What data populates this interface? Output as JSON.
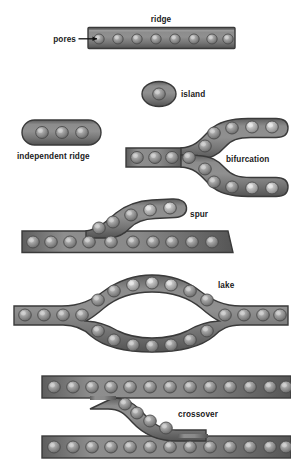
{
  "figure": {
    "background_color": "#ffffff",
    "ridge_fill_color": "#7c7c7c",
    "ridge_edge_color": "#3a3a3a",
    "pore_color": "#8f8f8f",
    "pore_highlight_color": "#c9c9c9",
    "label_color": "#1a1a1a"
  },
  "labels": {
    "ridge": "ridge",
    "pores": "pores",
    "island": "island",
    "independent_ridge": "independent ridge",
    "bifurcation": "bifurcation",
    "spur": "spur",
    "lake": "lake",
    "crossover": "crossover"
  },
  "features": [
    {
      "id": "ridge",
      "label": "ridge",
      "description": "straight horizontal ridge segment with a row of pores",
      "pore_count": 8
    },
    {
      "id": "pores",
      "label": "pores",
      "description": "leader line pointing to the first pore of the ridge",
      "pore_count": 1
    },
    {
      "id": "island",
      "label": "island",
      "description": "small isolated oval ridge fragment containing a single pore",
      "pore_count": 1
    },
    {
      "id": "independent-ridge",
      "label": "independent ridge",
      "description": "short isolated elongated ridge containing three pores",
      "pore_count": 3
    },
    {
      "id": "bifurcation",
      "label": "bifurcation",
      "description": "single ridge splitting into two ridges forming a Y fork",
      "pore_count": 16
    },
    {
      "id": "spur",
      "label": "spur",
      "description": "short ridge branching off from a longer ridge",
      "pore_count": 16
    },
    {
      "id": "lake",
      "label": "lake",
      "description": "ridge splitting and rejoining enclosing an empty oval area",
      "pore_count": 28
    },
    {
      "id": "crossover",
      "label": "crossover",
      "description": "short ridge connecting two parallel ridges diagonally",
      "pore_count": 30
    }
  ]
}
